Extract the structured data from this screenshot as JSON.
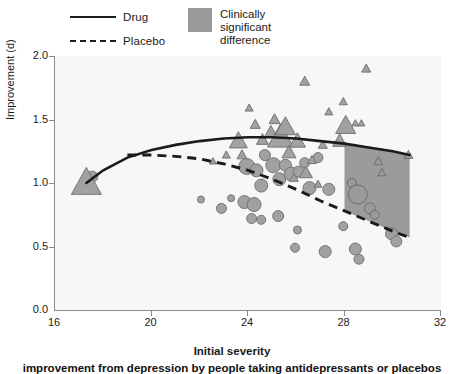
{
  "legend": {
    "drug_label": "Drug",
    "placebo_label": "Placebo",
    "region_line1": "Clinically",
    "region_line2": "significant",
    "region_line3": "difference",
    "swatch_color": "#9b9b9b"
  },
  "caption": "improvement from depression by people taking antidepressants or placebos",
  "chart_data": {
    "type": "scatter",
    "title": "",
    "xlabel": "Initial severity",
    "ylabel": "Improvement (d)",
    "xlim": [
      16,
      32
    ],
    "ylim": [
      0.0,
      2.0
    ],
    "xticks": [
      16,
      20,
      24,
      28,
      32
    ],
    "yticks": [
      "0.0",
      "0.5",
      "1.0",
      "1.5",
      "2.0"
    ],
    "grid": false,
    "legend_position": "above-plot-left",
    "marker_fill": "#9a9a9a",
    "marker_stroke": "#6b6b6b",
    "plot_background": "#f7f7f7",
    "annotations": [
      {
        "name": "clinically-significant-difference-region",
        "type": "shaded-band",
        "x_start": 28.0,
        "x_end": 30.7,
        "color": "#9b9b9b",
        "bounded_above_by": "Drug",
        "bounded_below_by": "Placebo"
      }
    ],
    "series": [
      {
        "name": "Drug",
        "marker": "triangle",
        "style": "solid-curve",
        "curve": [
          [
            17.3,
            1.0
          ],
          [
            18.0,
            1.1
          ],
          [
            19.0,
            1.2
          ],
          [
            20.0,
            1.26
          ],
          [
            21.0,
            1.3
          ],
          [
            22.0,
            1.33
          ],
          [
            23.0,
            1.35
          ],
          [
            24.0,
            1.36
          ],
          [
            25.0,
            1.36
          ],
          [
            26.0,
            1.35
          ],
          [
            27.0,
            1.33
          ],
          [
            28.0,
            1.31
          ],
          [
            29.0,
            1.28
          ],
          [
            30.0,
            1.25
          ],
          [
            30.7,
            1.22
          ]
        ],
        "points": [
          [
            17.3,
            1.0,
            30
          ],
          [
            23.6,
            1.33,
            18
          ],
          [
            23.75,
            1.22,
            10
          ],
          [
            24.3,
            1.46,
            10
          ],
          [
            24.6,
            1.34,
            12
          ],
          [
            24.95,
            1.4,
            13
          ],
          [
            25.1,
            1.5,
            11
          ],
          [
            25.35,
            1.36,
            26
          ],
          [
            25.55,
            1.44,
            20
          ],
          [
            25.7,
            1.24,
            14
          ],
          [
            26.05,
            1.33,
            16
          ],
          [
            26.35,
            1.8,
            10
          ],
          [
            26.4,
            1.08,
            13
          ],
          [
            26.65,
            1.18,
            9
          ],
          [
            27.1,
            1.3,
            9
          ],
          [
            27.35,
            1.56,
            8
          ],
          [
            27.8,
            1.33,
            14
          ],
          [
            27.95,
            1.64,
            8
          ],
          [
            28.05,
            1.45,
            20
          ],
          [
            28.45,
            1.47,
            7
          ],
          [
            28.7,
            1.47,
            7
          ],
          [
            28.9,
            1.9,
            9
          ],
          [
            29.4,
            1.17,
            9
          ],
          [
            29.55,
            1.08,
            8
          ],
          [
            30.65,
            1.22,
            9
          ],
          [
            23.1,
            1.22,
            8
          ],
          [
            24.05,
            1.59,
            8
          ],
          [
            22.55,
            1.17,
            7
          ],
          [
            26.9,
            0.99,
            8
          ],
          [
            25.9,
            1.04,
            9
          ]
        ]
      },
      {
        "name": "Placebo",
        "marker": "circle",
        "style": "dashed-curve",
        "curve": [
          [
            19.0,
            1.22
          ],
          [
            20.0,
            1.22
          ],
          [
            21.0,
            1.21
          ],
          [
            22.0,
            1.19
          ],
          [
            23.0,
            1.15
          ],
          [
            24.0,
            1.1
          ],
          [
            25.0,
            1.03
          ],
          [
            26.0,
            0.95
          ],
          [
            27.0,
            0.86
          ],
          [
            28.0,
            0.78
          ],
          [
            29.0,
            0.7
          ],
          [
            30.0,
            0.62
          ],
          [
            30.7,
            0.57
          ]
        ],
        "points": [
          [
            17.55,
            1.05,
            11
          ],
          [
            23.95,
            1.13,
            16
          ],
          [
            24.35,
            1.1,
            13
          ],
          [
            24.55,
            0.98,
            13
          ],
          [
            24.7,
            1.22,
            11
          ],
          [
            25.05,
            1.14,
            15
          ],
          [
            25.3,
            1.03,
            13
          ],
          [
            25.55,
            1.14,
            12
          ],
          [
            25.8,
            1.07,
            14
          ],
          [
            26.1,
            1.09,
            11
          ],
          [
            26.35,
            1.16,
            10
          ],
          [
            26.55,
            0.96,
            13
          ],
          [
            26.9,
            1.2,
            10
          ],
          [
            27.35,
            0.95,
            12
          ],
          [
            28.3,
            1.0,
            9
          ],
          [
            28.55,
            0.91,
            19
          ],
          [
            29.05,
            0.8,
            11
          ],
          [
            29.25,
            0.75,
            9
          ],
          [
            29.95,
            0.6,
            12
          ],
          [
            30.15,
            0.54,
            11
          ],
          [
            23.3,
            0.88,
            7
          ],
          [
            23.85,
            0.85,
            13
          ],
          [
            24.25,
            0.83,
            14
          ],
          [
            24.15,
            0.72,
            10
          ],
          [
            24.55,
            0.71,
            9
          ],
          [
            25.25,
            0.74,
            11
          ],
          [
            22.05,
            0.87,
            7
          ],
          [
            25.95,
            0.49,
            9
          ],
          [
            27.2,
            0.46,
            12
          ],
          [
            28.45,
            0.48,
            12
          ],
          [
            28.6,
            0.4,
            10
          ],
          [
            26.05,
            0.63,
            8
          ],
          [
            27.95,
            0.66,
            9
          ],
          [
            22.9,
            0.8,
            10
          ]
        ]
      }
    ]
  }
}
